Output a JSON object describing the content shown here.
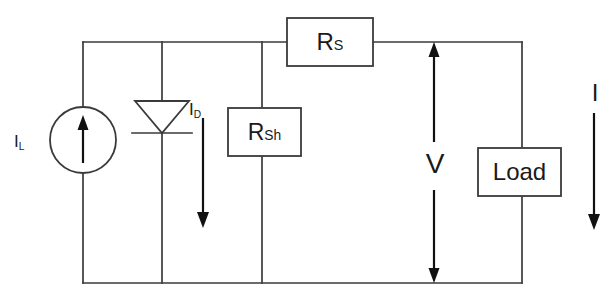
{
  "diagram": {
    "type": "electrical-schematic",
    "background_color": "#ffffff",
    "wire_color": "#3a3a3a",
    "text_color": "#1a1a1a"
  },
  "labels": {
    "current_source": "I",
    "current_source_sub": "L",
    "diode_current": "I",
    "diode_current_sub": "D",
    "series_resistor": "R",
    "series_resistor_sub": "S",
    "shunt_resistor": "R",
    "shunt_resistor_sub": "Sh",
    "voltage": "V",
    "load": "Load",
    "output_current": "I"
  },
  "components": [
    {
      "name": "current-source",
      "symbol": "circle-with-up-arrow",
      "label": "I_L",
      "cx": 83,
      "cy": 140,
      "r": 33
    },
    {
      "name": "diode",
      "symbol": "triangle-with-bar",
      "label": "I_D",
      "x": 162,
      "y": 133,
      "orientation": "cathode-down"
    },
    {
      "name": "shunt-resistor",
      "symbol": "rectangle",
      "label": "R_Sh",
      "x": 228,
      "y": 108,
      "width": 73,
      "height": 48
    },
    {
      "name": "series-resistor",
      "symbol": "rectangle",
      "label": "R_S",
      "x": 287,
      "y": 18,
      "width": 86,
      "height": 48
    },
    {
      "name": "load",
      "symbol": "rectangle",
      "label": "Load",
      "x": 478,
      "y": 148,
      "width": 83,
      "height": 48
    }
  ],
  "annotations": [
    {
      "name": "diode-current-arrow",
      "direction": "down",
      "x": 203,
      "y_start": 118,
      "y_end": 224
    },
    {
      "name": "voltage-arrow",
      "direction": "double-vertical",
      "x": 434,
      "y_start": 42,
      "y_end": 283
    },
    {
      "name": "output-current-arrow",
      "direction": "down",
      "x": 594,
      "y_start": 113,
      "y_end": 230
    }
  ],
  "nodes": {
    "top_rail_y": 42,
    "bottom_rail_y": 283,
    "left_branch_x": 83,
    "diode_branch_x": 162,
    "shunt_branch_x": 262,
    "output_branch_x": 522
  }
}
